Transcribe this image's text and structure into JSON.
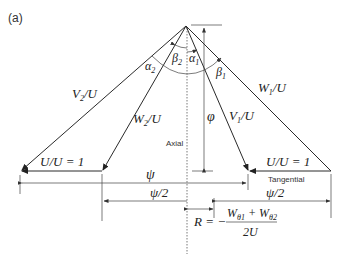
{
  "figure": {
    "panel_label": "(a)",
    "vectors": {
      "v2": "V",
      "v2_sub": "2",
      "v2_den": "/U",
      "w2": "W",
      "w2_sub": "2",
      "w2_den": "/U",
      "v1": "V",
      "v1_sub": "1",
      "v1_den": "/U",
      "w1": "W",
      "w1_sub": "1",
      "w1_den": "/U",
      "u_left": "U/U = 1",
      "u_right": "U/U = 1"
    },
    "angles": {
      "alpha2": "α",
      "alpha2_sub": "2",
      "beta2": "β",
      "beta2_sub": "2",
      "alpha1": "α",
      "alpha1_sub": "1",
      "beta1": "β",
      "beta1_sub": "1"
    },
    "dimensions": {
      "phi": "φ",
      "psi": "ψ",
      "psi_half_left": "ψ/2",
      "psi_half_right": "ψ/2"
    },
    "axis_labels": {
      "axial": "Axial",
      "tangential": "Tangential"
    },
    "formula": {
      "lhs": "R = −",
      "num_w": "W",
      "num_sub1": "θ1",
      "num_plus": " + W",
      "num_sub2": "θ2",
      "den": "2U"
    }
  }
}
